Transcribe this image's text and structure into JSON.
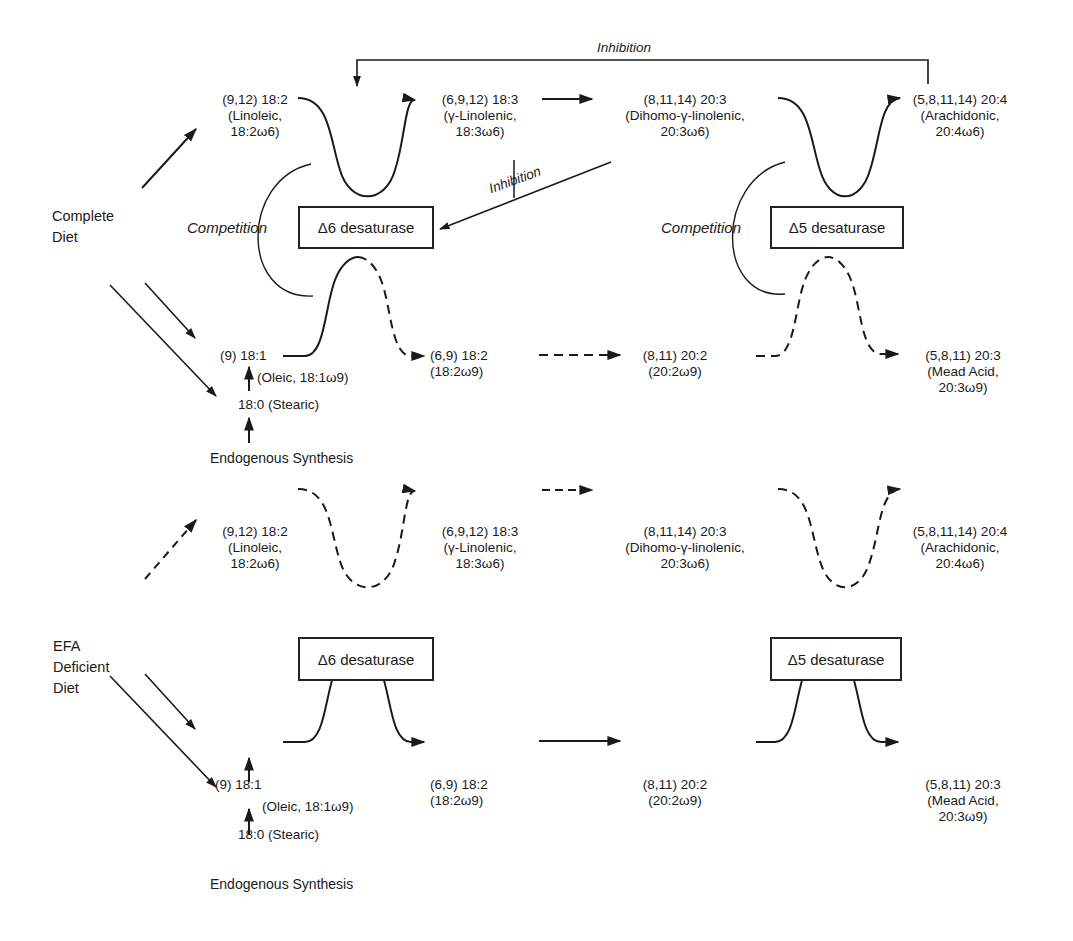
{
  "panels": [
    {
      "id": "complete",
      "diet_label": [
        "Complete",
        "Diet"
      ],
      "enzymes": {
        "d6": "Δ6 desaturase",
        "d5": "Δ5 desaturase"
      },
      "competition": [
        "Competition",
        "Competition"
      ],
      "inhibition": [
        "Inhibition",
        "Inhibition"
      ],
      "omega6": [
        {
          "head": "(9,12) 18:2",
          "l2": "(Linoleic,",
          "l3": "18:2ω6)"
        },
        {
          "head": "(6,9,12) 18:3",
          "l2": "(γ-Linolenic,",
          "l3": "18:3ω6)"
        },
        {
          "head": "(8,11,14) 20:3",
          "l2": "(Dihomo-γ-linolenic,",
          "l3": "20:3ω6)"
        },
        {
          "head": "(5,8,11,14) 20:4",
          "l2": "(Arachidonic,",
          "l3": "20:4ω6)"
        }
      ],
      "omega9": [
        {
          "head": "(9) 18:1",
          "l2": "(Oleic, 18:1ω9)"
        },
        {
          "head": "(6,9) 18:2",
          "l2": "(18:2ω9)"
        },
        {
          "head": "(8,11) 20:2",
          "l2": "(20:2ω9)"
        },
        {
          "head": "(5,8,11) 20:3",
          "l2": "(Mead Acid,",
          "l3": "20:3ω9)"
        }
      ],
      "stearic": "18:0  (Stearic)",
      "synthesis": "Endogenous Synthesis"
    },
    {
      "id": "efa-deficient",
      "diet_label": [
        "EFA",
        "Deficient",
        "Diet"
      ],
      "enzymes": {
        "d6": "Δ6 desaturase",
        "d5": "Δ5 desaturase"
      },
      "omega6": [
        {
          "head": "(9,12) 18:2",
          "l2": "(Linoleic,",
          "l3": "18:2ω6)"
        },
        {
          "head": "(6,9,12) 18:3",
          "l2": "(γ-Linolenic,",
          "l3": "18:3ω6)"
        },
        {
          "head": "(8,11,14) 20:3",
          "l2": "(Dihomo-γ-linolenic,",
          "l3": "20:3ω6)"
        },
        {
          "head": "(5,8,11,14) 20:4",
          "l2": "(Arachidonic,",
          "l3": "20:4ω6)"
        }
      ],
      "omega9": [
        {
          "head": "(9) 18:1",
          "l2": "(Oleic, 18:1ω9)"
        },
        {
          "head": "(6,9) 18:2",
          "l2": "(18:2ω9)"
        },
        {
          "head": "(8,11) 20:2",
          "l2": "(20:2ω9)"
        },
        {
          "head": "(5,8,11) 20:3",
          "l2": "(Mead Acid,",
          "l3": "20:3ω9)"
        }
      ],
      "stearic": "18:0  (Stearic)",
      "synthesis": "Endogenous Synthesis"
    }
  ],
  "colors": {
    "ink": "#1a1a1a",
    "background": "#ffffff"
  }
}
